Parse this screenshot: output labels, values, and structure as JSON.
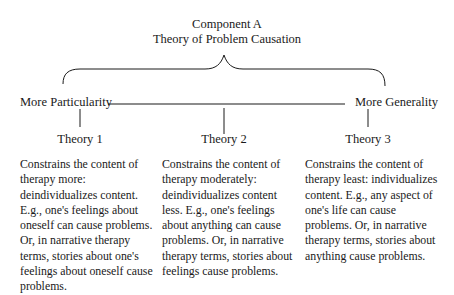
{
  "header": {
    "line1": "Component A",
    "line2": "Theory of Problem Causation"
  },
  "continuum": {
    "left_label": "More Particularity",
    "right_label": "More Generality"
  },
  "theories": [
    {
      "label": "Theory 1",
      "description": "Constrains the content of therapy more: deindividualizes content. E.g., one's feelings about oneself can cause problems. Or, in narrative therapy terms, stories about one's feelings about oneself cause problems."
    },
    {
      "label": "Theory 2",
      "description": "Constrains the content of therapy moderately: deindividualizes content less. E.g., one's feelings about anything can cause problems. Or, in narrative therapy terms, stories about feelings cause problems."
    },
    {
      "label": "Theory 3",
      "description": "Constrains the content of therapy least: individualizes content. E.g., any aspect of one's life can cause problems. Or, in narrative therapy terms, stories about anything cause problems."
    }
  ],
  "colors": {
    "ink": "#1a1a1a",
    "background": "#ffffff"
  }
}
